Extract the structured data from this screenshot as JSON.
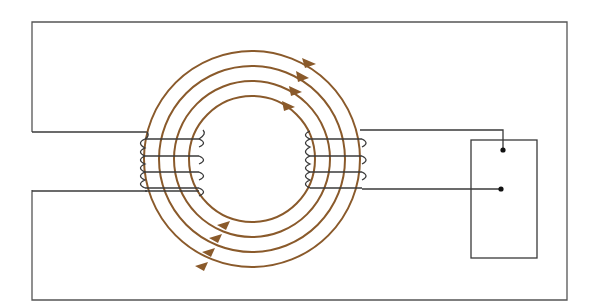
{
  "diagram": {
    "type": "toroidal transformer schematic",
    "colors": {
      "background": "#ffffff",
      "wire": "#3a3a3a",
      "flux_lines": "#8a5a2b",
      "frame": "#555555"
    },
    "core": {
      "center": [
        252,
        159
      ],
      "flux_line_radii": [
        108,
        93,
        78,
        63
      ],
      "flux_direction": "clockwise"
    },
    "primary_winding": {
      "side": "left",
      "turns": 4
    },
    "secondary_winding": {
      "side": "right",
      "turns": 4
    },
    "load_box": {
      "terminals": 2
    }
  }
}
